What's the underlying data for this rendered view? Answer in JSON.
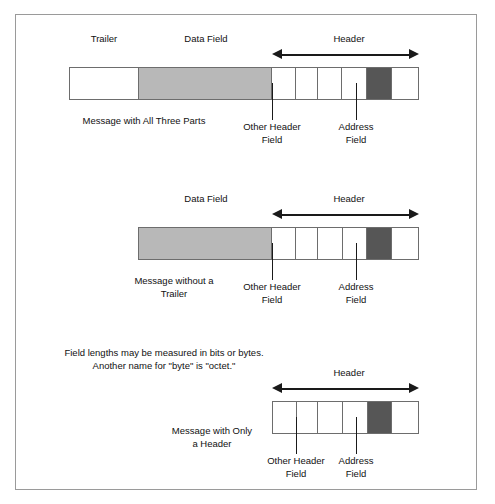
{
  "figure": {
    "note": "Field lengths may be measured in bits or bytes.\nAnother name for \"byte\" is \"octet.\"",
    "labels": {
      "trailer": "Trailer",
      "data_field": "Data Field",
      "header": "Header",
      "other_header_field": "Other Header\nField",
      "address_field": "Address\nField"
    },
    "colors": {
      "data_fill": "#b8b8b8",
      "address_fill": "#565656",
      "empty_fill": "#ffffff",
      "stroke": "#6d6d6d",
      "arrow": "#1a1a1a",
      "frame": "#9a9a9a"
    }
  },
  "diagrams": [
    {
      "id": "message-all-three-parts",
      "caption": "Message with All Three Parts",
      "top_labels": [
        "Trailer",
        "Data Field",
        "Header"
      ],
      "header_label": "Header",
      "segments": [
        {
          "name": "trailer",
          "kind": "trailer",
          "label": "Trailer"
        },
        {
          "name": "data-field",
          "kind": "data",
          "label": "Data Field"
        },
        {
          "name": "header-field-1",
          "kind": "plain",
          "label": ""
        },
        {
          "name": "other-header-field",
          "kind": "plain",
          "label": "Other Header Field"
        },
        {
          "name": "header-field-3",
          "kind": "plain",
          "label": ""
        },
        {
          "name": "header-field-4",
          "kind": "plain",
          "label": ""
        },
        {
          "name": "address-field",
          "kind": "addr",
          "label": "Address Field"
        },
        {
          "name": "header-field-6",
          "kind": "plain",
          "label": ""
        }
      ],
      "callouts": [
        "Other Header\nField",
        "Address\nField"
      ]
    },
    {
      "id": "message-without-trailer",
      "caption": "Message without a\nTrailer",
      "top_labels": [
        "Data Field",
        "Header"
      ],
      "header_label": "Header",
      "segments": [
        {
          "name": "data-field",
          "kind": "data",
          "label": "Data Field"
        },
        {
          "name": "header-field-1",
          "kind": "plain",
          "label": ""
        },
        {
          "name": "other-header-field",
          "kind": "plain",
          "label": "Other Header Field"
        },
        {
          "name": "header-field-3",
          "kind": "plain",
          "label": ""
        },
        {
          "name": "header-field-4",
          "kind": "plain",
          "label": ""
        },
        {
          "name": "address-field",
          "kind": "addr",
          "label": "Address Field"
        },
        {
          "name": "header-field-6",
          "kind": "plain",
          "label": ""
        }
      ],
      "callouts": [
        "Other Header\nField",
        "Address\nField"
      ]
    },
    {
      "id": "message-only-header",
      "caption": "Message with Only\na Header",
      "top_labels": [
        "Header"
      ],
      "header_label": "Header",
      "segments": [
        {
          "name": "header-field-1",
          "kind": "plain",
          "label": ""
        },
        {
          "name": "other-header-field",
          "kind": "plain",
          "label": "Other Header Field"
        },
        {
          "name": "header-field-3",
          "kind": "plain",
          "label": ""
        },
        {
          "name": "header-field-4",
          "kind": "plain",
          "label": ""
        },
        {
          "name": "address-field",
          "kind": "addr",
          "label": "Address Field"
        },
        {
          "name": "header-field-6",
          "kind": "plain",
          "label": ""
        }
      ],
      "callouts": [
        "Other Header\nField",
        "Address\nField"
      ]
    }
  ]
}
